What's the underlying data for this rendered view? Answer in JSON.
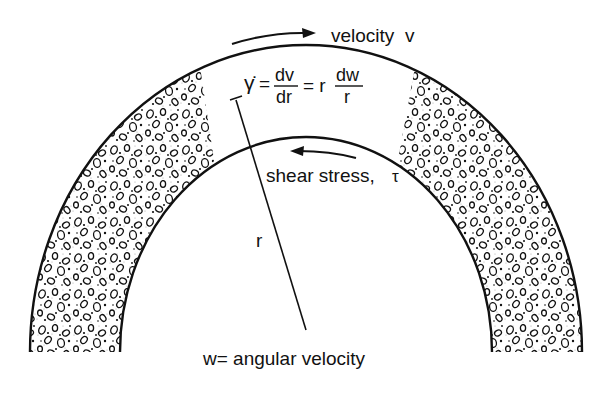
{
  "labels": {
    "velocity": "velocity  v",
    "shear_stress": "shear stress,",
    "tau": "τ",
    "radius": "r",
    "angular_velocity": "w= angular velocity"
  },
  "equation": {
    "gamma_dot": "γ̇",
    "eq1": "=",
    "frac1_num": "dv",
    "frac1_den": "dr",
    "eq2": "= r",
    "frac2_num": "dw",
    "frac2_den": "r"
  },
  "colors": {
    "ink": "#111111",
    "background": "#ffffff",
    "stipple": "#9a9a9a"
  }
}
